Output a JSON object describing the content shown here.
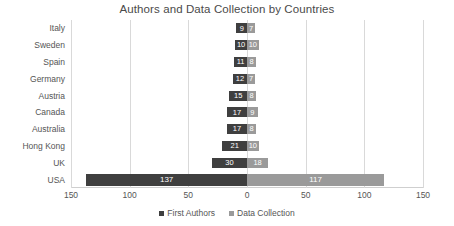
{
  "chart_data": {
    "type": "bar",
    "title": "Authors and Data Collection by Countries",
    "orientation": "horizontal",
    "layout": "diverging-bidirectional",
    "xlabel": "",
    "ylabel": "",
    "xlim": [
      -150,
      150
    ],
    "xticks": [
      "150",
      "100",
      "50",
      "0",
      "50",
      "100",
      "150"
    ],
    "xtick_values": [
      -150,
      -100,
      -50,
      0,
      50,
      100,
      150
    ],
    "grid": true,
    "legend_position": "bottom",
    "categories": [
      "Italy",
      "Sweden",
      "Spain",
      "Germany",
      "Austria",
      "Canada",
      "Australia",
      "Hong Kong",
      "UK",
      "USA"
    ],
    "series": [
      {
        "name": "First Authors",
        "color": "#3f3f3f",
        "direction": "left",
        "values": [
          9,
          10,
          11,
          12,
          15,
          17,
          17,
          21,
          30,
          137
        ]
      },
      {
        "name": "Data Collection",
        "color": "#9a9a9a",
        "direction": "right",
        "values": [
          7,
          10,
          8,
          7,
          8,
          9,
          8,
          10,
          18,
          117
        ]
      }
    ]
  },
  "colors": {
    "first_authors": "#3f3f3f",
    "data_collection": "#9a9a9a",
    "gridline": "#d9d9d9",
    "text": "#555555",
    "title": "#4a4a4a"
  }
}
